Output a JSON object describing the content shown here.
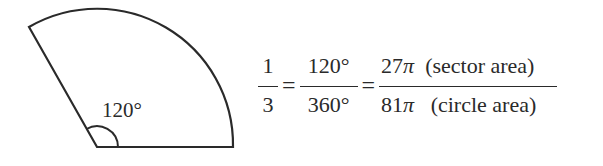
{
  "figure": {
    "type": "sector",
    "angle_label": "120°",
    "stroke_color": "#2a2a2a",
    "geometry": {
      "center": [
        97,
        147
      ],
      "radius": 136,
      "start_point": [
        233,
        147
      ],
      "end_point": [
        29,
        27
      ]
    }
  },
  "equation": {
    "fraction1": {
      "numerator": "1",
      "denominator": "3"
    },
    "equals1": "=",
    "fraction2": {
      "numerator": "120°",
      "denominator": "360°"
    },
    "equals2": "=",
    "fraction3": {
      "numerator_value": "27",
      "numerator_pi": "π",
      "numerator_note": "  (sector area)",
      "denominator_value": "81",
      "denominator_pi": "π",
      "denominator_note": "   (circle area)"
    }
  }
}
